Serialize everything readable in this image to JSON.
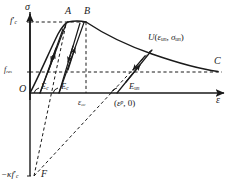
{
  "figure": {
    "kind": "stress-strain-diagram",
    "title": "",
    "background_color": "#ffffff",
    "line_color": "#1a1a1a",
    "text_color": "#1a1a1a"
  },
  "axes": {
    "y_label": "σ",
    "x_label": "ε",
    "origin_label": "O"
  },
  "y_ticks": [
    {
      "id": "fc",
      "base": "f",
      "sub": "c",
      "prime": "′",
      "text": "f′c",
      "value_y_px": 22
    },
    {
      "id": "fres",
      "base": "f",
      "sub": "res",
      "prime": "",
      "text": "fres",
      "value_y_px": 72
    },
    {
      "id": "kappa_fc",
      "base": "−κf",
      "sub": "c",
      "prime": "′",
      "text": "−κf′c",
      "value_y_px": 176
    }
  ],
  "points": [
    {
      "id": "A",
      "label": "A",
      "x_px": 68,
      "y_px": 22
    },
    {
      "id": "B",
      "label": "B",
      "x_px": 86,
      "y_px": 22
    },
    {
      "id": "C",
      "label": "C",
      "x_px": 216,
      "y_px": 72
    },
    {
      "id": "F",
      "label": "F",
      "x_px": 34,
      "y_px": 176
    },
    {
      "id": "U",
      "label": "U",
      "x_px": 152,
      "y_px": 48
    }
  ],
  "annotations": {
    "unload_point": {
      "text": "U(εun, σun)",
      "fn": "U",
      "open": "(",
      "eps_base": "ε",
      "eps_sub": "un",
      "comma": ", ",
      "sig_base": "σ",
      "sig_sub": "un",
      "close": ")"
    },
    "plastic_strain": {
      "text": "(εp, 0)",
      "open": "(",
      "eps_base": "ε",
      "eps_sup": "p",
      "rest": ", 0)"
    },
    "eps_cc": {
      "base": "ε",
      "sub": "cc",
      "text": "εcc"
    },
    "moduli": [
      {
        "id": "Ec-1",
        "base": "E",
        "sub": "c",
        "text": "Ec"
      },
      {
        "id": "Ec-2",
        "base": "E",
        "sub": "c",
        "text": "Ec"
      },
      {
        "id": "Eun",
        "base": "E",
        "sub": "un",
        "text": "Eun"
      }
    ]
  },
  "curve_notes": {
    "envelope": "ascending branch O–A, plateau A–B at f′c, softening branch B–C approaching fres",
    "hysteresis_loops": 2,
    "focus_point": "F",
    "dashed_guides": [
      "f′c level",
      "fres level",
      "εcc vertical",
      "focal lines to F"
    ]
  }
}
